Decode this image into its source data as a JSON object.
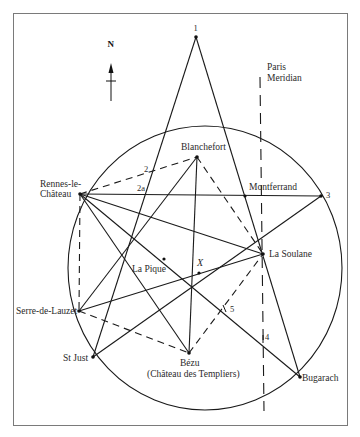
{
  "compass": {
    "label": "N"
  },
  "meridian": {
    "label_line1": "Paris",
    "label_line2": "Meridian"
  },
  "points": {
    "p1": {
      "label": "1"
    },
    "p2": {
      "label": "2"
    },
    "p2a": {
      "label": "2a"
    },
    "p3": {
      "label": "3"
    },
    "p4": {
      "label": "4"
    },
    "p5": {
      "label": "5"
    },
    "x": {
      "label": "X"
    }
  },
  "places": {
    "blanchefort": {
      "label": "Blanchefort"
    },
    "rennes": {
      "label_line1": "Rennes-le-",
      "label_line2": "Château"
    },
    "montferrand": {
      "label": "Montferrand"
    },
    "la_soulane": {
      "label": "La Soulane"
    },
    "la_pique": {
      "label": "La Pique"
    },
    "serre": {
      "label": "Serre-de-Lauzet"
    },
    "st_just": {
      "label": "St Just"
    },
    "bezu": {
      "label_line1": "Bézu",
      "label_line2": "(Château des Templiers)"
    },
    "bugarach": {
      "label": "Bugarach"
    }
  }
}
